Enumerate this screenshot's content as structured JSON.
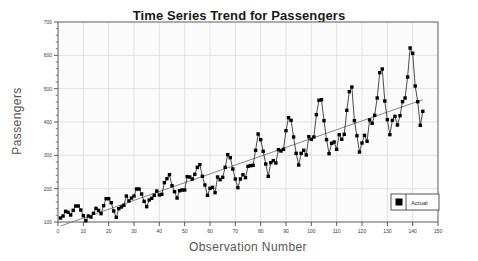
{
  "chart_data": {
    "type": "line",
    "title": "Time Series Trend for Passengers",
    "xlabel": "Observation Number",
    "ylabel": "Passengers",
    "grid": true,
    "legend_position": "bottom-right",
    "xlim": [
      0,
      150
    ],
    "ylim": [
      100,
      700
    ],
    "xticks": [
      0,
      10,
      20,
      30,
      40,
      50,
      60,
      70,
      80,
      90,
      100,
      110,
      120,
      130,
      140,
      150
    ],
    "yticks": [
      100,
      200,
      300,
      400,
      500,
      600,
      700
    ],
    "xtick_labels": [
      "0",
      "10",
      "20",
      "30",
      "40",
      "50",
      "60",
      "70",
      "80",
      "90",
      "100",
      "110",
      "120",
      "130",
      "140",
      "150"
    ],
    "ytick_labels": [
      "100",
      "200",
      "300",
      "400",
      "500",
      "600",
      "700"
    ],
    "series": [
      {
        "name": "Actual",
        "marker": "square",
        "color": "#000000",
        "x": [
          1,
          2,
          3,
          4,
          5,
          6,
          7,
          8,
          9,
          10,
          11,
          12,
          13,
          14,
          15,
          16,
          17,
          18,
          19,
          20,
          21,
          22,
          23,
          24,
          25,
          26,
          27,
          28,
          29,
          30,
          31,
          32,
          33,
          34,
          35,
          36,
          37,
          38,
          39,
          40,
          41,
          42,
          43,
          44,
          45,
          46,
          47,
          48,
          49,
          50,
          51,
          52,
          53,
          54,
          55,
          56,
          57,
          58,
          59,
          60,
          61,
          62,
          63,
          64,
          65,
          66,
          67,
          68,
          69,
          70,
          71,
          72,
          73,
          74,
          75,
          76,
          77,
          78,
          79,
          80,
          81,
          82,
          83,
          84,
          85,
          86,
          87,
          88,
          89,
          90,
          91,
          92,
          93,
          94,
          95,
          96,
          97,
          98,
          99,
          100,
          101,
          102,
          103,
          104,
          105,
          106,
          107,
          108,
          109,
          110,
          111,
          112,
          113,
          114,
          115,
          116,
          117,
          118,
          119,
          120,
          121,
          122,
          123,
          124,
          125,
          126,
          127,
          128,
          129,
          130,
          131,
          132,
          133,
          134,
          135,
          136,
          137,
          138,
          139,
          140,
          141,
          142,
          143,
          144
        ],
        "values": [
          112,
          118,
          132,
          129,
          121,
          135,
          148,
          148,
          136,
          119,
          104,
          118,
          115,
          126,
          141,
          135,
          125,
          149,
          170,
          170,
          158,
          133,
          114,
          140,
          145,
          150,
          178,
          163,
          172,
          178,
          199,
          199,
          184,
          162,
          146,
          166,
          171,
          180,
          193,
          181,
          183,
          218,
          230,
          242,
          209,
          191,
          172,
          194,
          196,
          196,
          236,
          235,
          229,
          243,
          264,
          272,
          237,
          211,
          180,
          201,
          204,
          188,
          235,
          227,
          234,
          264,
          302,
          293,
          259,
          229,
          203,
          229,
          242,
          233,
          267,
          269,
          270,
          315,
          364,
          347,
          312,
          274,
          237,
          278,
          284,
          277,
          317,
          313,
          318,
          374,
          413,
          405,
          355,
          306,
          271,
          306,
          315,
          301,
          356,
          348,
          355,
          422,
          465,
          467,
          404,
          347,
          305,
          336,
          340,
          318,
          362,
          348,
          363,
          435,
          491,
          505,
          404,
          359,
          310,
          337,
          360,
          342,
          406,
          396,
          420,
          472,
          548,
          559,
          463,
          407,
          362,
          405,
          417,
          391,
          419,
          461,
          472,
          535,
          622,
          606,
          508,
          461,
          390,
          432
        ]
      },
      {
        "name": "Trend",
        "marker": "none",
        "color": "#6a6a6a",
        "x": [
          1,
          144
        ],
        "values": [
          88.0,
          467.0
        ]
      }
    ],
    "legend": [
      {
        "label": "Actual",
        "marker": "square",
        "color": "#000000"
      }
    ]
  },
  "colors": {
    "background": "#ffffff",
    "plot_background": "#fbfbfb",
    "grid": "#d8d8d8",
    "axis": "#4a4a4a",
    "title_text": "#1a1a1a",
    "axis_label_text": "#555555",
    "marker": "#000000",
    "trend": "#6a6a6a",
    "legend_border": "#444444"
  }
}
